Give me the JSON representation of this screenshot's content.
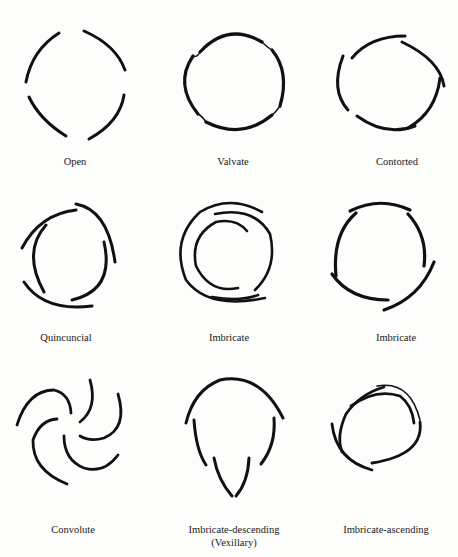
{
  "figure": {
    "diagrams": [
      {
        "id": "open",
        "label": "Open"
      },
      {
        "id": "valvate",
        "label": "Valvate"
      },
      {
        "id": "contorted",
        "label": "Contorted"
      },
      {
        "id": "quincuncial",
        "label": "Quincuncial"
      },
      {
        "id": "imbricate-1",
        "label": "Imbricate"
      },
      {
        "id": "imbricate-2",
        "label": "Imbricate"
      },
      {
        "id": "convolute",
        "label": "Convolute"
      },
      {
        "id": "imbricate-descending",
        "label": "Imbricate-descending",
        "sublabel": "(Vexillary)"
      },
      {
        "id": "imbricate-ascending",
        "label": "Imbricate-ascending"
      }
    ]
  }
}
